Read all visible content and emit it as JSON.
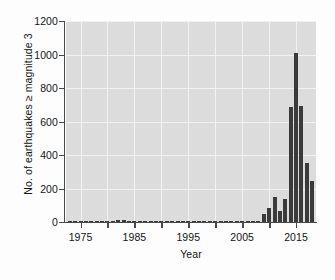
{
  "chart_data": {
    "type": "bar",
    "title": "",
    "xlabel": "Year",
    "ylabel": "No. of earthquakes ≥ magnitude 3",
    "xlim": [
      1972.3,
      2018.7
    ],
    "ylim": [
      0,
      1200
    ],
    "ytick_values": [
      0,
      200,
      400,
      600,
      800,
      1000,
      1200
    ],
    "ytick_labels": [
      "0",
      "200",
      "400",
      "600",
      "800",
      "1000",
      "1200"
    ],
    "xtick_values": [
      1975,
      1985,
      1995,
      2005,
      2015
    ],
    "xtick_labels": [
      "1975",
      "1985",
      "1995",
      "2005",
      "2015"
    ],
    "xtick_minor_values": [
      1980,
      1990,
      2000,
      2010
    ],
    "grid": "horizontal-and-vertical-white-on-gray",
    "legend": "none",
    "bar_color": "#3a3a3a",
    "plot_background": "#dcdcdc",
    "gridline_color": "#f2f2f2",
    "categories": [
      1973,
      1974,
      1975,
      1976,
      1977,
      1978,
      1979,
      1980,
      1981,
      1982,
      1983,
      1984,
      1985,
      1986,
      1987,
      1988,
      1989,
      1990,
      1991,
      1992,
      1993,
      1994,
      1995,
      1996,
      1997,
      1998,
      1999,
      2000,
      2001,
      2002,
      2003,
      2004,
      2005,
      2006,
      2007,
      2008,
      2009,
      2010,
      2011,
      2012,
      2013,
      2014,
      2015,
      2016,
      2017,
      2018
    ],
    "values": [
      4,
      5,
      3,
      2,
      2,
      1,
      1,
      2,
      8,
      10,
      12,
      6,
      5,
      4,
      3,
      3,
      5,
      4,
      2,
      3,
      7,
      5,
      4,
      3,
      2,
      3,
      2,
      4,
      6,
      5,
      3,
      4,
      6,
      5,
      4,
      8,
      50,
      85,
      150,
      65,
      140,
      685,
      1010,
      690,
      355,
      245
    ]
  },
  "axes": {
    "y_title": "No. of earthquakes ≥ magnitude 3",
    "x_title": "Year"
  }
}
